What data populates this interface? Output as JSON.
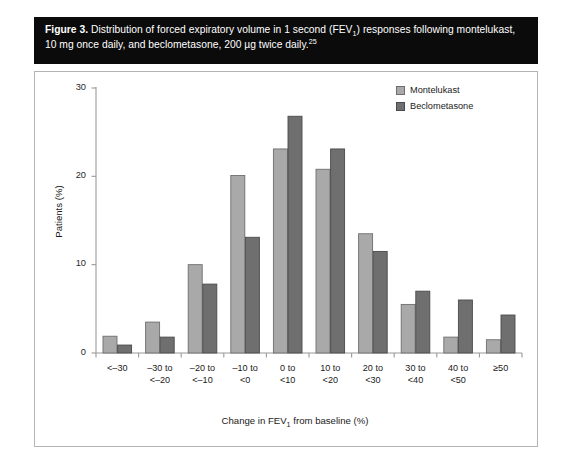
{
  "caption": {
    "figure_label": "Figure 3.",
    "text_part1": " Distribution of forced expiratory volume in 1 second (FEV",
    "fev_subscript": "1",
    "text_part2": ") responses following montelukast, 10 mg once daily, and beclometasone, 200 µg twice daily.",
    "reference_superscript": "25"
  },
  "legend": {
    "items": [
      {
        "label": "Montelukast",
        "color": "#a9a9a9",
        "border": "#6e6e6e"
      },
      {
        "label": "Beclometasone",
        "color": "#6f6f6f",
        "border": "#4a4a4a"
      }
    ]
  },
  "axes": {
    "y_title": "Patients (%)",
    "x_title_part1": "Change in FEV",
    "x_title_sub": "1",
    "x_title_part2": " from baseline (%)",
    "y_ticks": [
      "0",
      "10",
      "20",
      "30"
    ]
  },
  "chart_data": {
    "type": "bar",
    "xlabel": "Change in FEV1 from baseline (%)",
    "ylabel": "Patients (%)",
    "ylim": [
      0,
      30
    ],
    "yticks": [
      0,
      10,
      20,
      30
    ],
    "grid": false,
    "legend_position": "top-right",
    "categories": [
      "<–30",
      "–30 to <–20",
      "–20 to <–10",
      "–10 to <0",
      "0 to <10",
      "10 to <20",
      "20 to <30",
      "30 to <40",
      "40 to <50",
      "≥50"
    ],
    "category_lines": [
      [
        "<–30",
        ""
      ],
      [
        "–30 to",
        "<–20"
      ],
      [
        "–20 to",
        "<–10"
      ],
      [
        "–10 to",
        "<0"
      ],
      [
        "0 to",
        "<10"
      ],
      [
        "10 to",
        "<20"
      ],
      [
        "20 to",
        "<30"
      ],
      [
        "30 to",
        "<40"
      ],
      [
        "40 to",
        "<50"
      ],
      [
        "≥50",
        ""
      ]
    ],
    "series": [
      {
        "name": "Montelukast",
        "color": "#a9a9a9",
        "values": [
          1.9,
          3.5,
          10.0,
          20.1,
          23.1,
          20.8,
          13.5,
          5.5,
          1.8,
          1.5
        ]
      },
      {
        "name": "Beclometasone",
        "color": "#6f6f6f",
        "values": [
          0.9,
          1.8,
          7.8,
          13.1,
          26.8,
          23.1,
          11.5,
          7.0,
          6.0,
          4.3
        ]
      }
    ]
  }
}
